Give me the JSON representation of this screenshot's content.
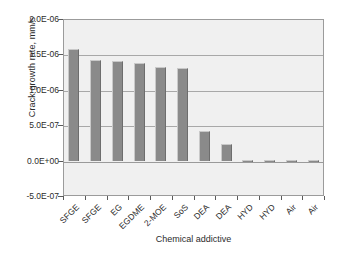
{
  "chart_data": {
    "type": "bar",
    "title": "",
    "xlabel": "Chemical addictive",
    "ylabel": "Crack growth rate, mm/s",
    "categories": [
      "SFGE",
      "SFGE",
      "EG",
      "EGDME",
      "2-MOE",
      "SoS",
      "DEA",
      "DEA",
      "HYD",
      "HYD",
      "Air",
      "Air"
    ],
    "values": [
      1.58e-06,
      1.42e-06,
      1.4e-06,
      1.38e-06,
      1.32e-06,
      1.31e-06,
      4.2e-07,
      2.3e-07,
      0.0,
      0.0,
      0.0,
      0.0
    ],
    "ylim": [
      -5e-07,
      2e-06
    ],
    "ytick_values": [
      2e-06,
      1.5e-06,
      1e-06,
      5e-07,
      0.0,
      -5e-07
    ],
    "ytick_labels": [
      "2.0E-06",
      "1.5E-06",
      "1.0E-06",
      "5.0E-07",
      "0.0E+00",
      "-5.0E-07"
    ],
    "grid": true,
    "legend": "none",
    "bar_color": "#8a8a8a",
    "plot_background": "#f0f0f0",
    "axis_color": "#9b9b9b",
    "gridline_color": "#a8a8a8",
    "zero_bar_stub_height": 0.006
  }
}
